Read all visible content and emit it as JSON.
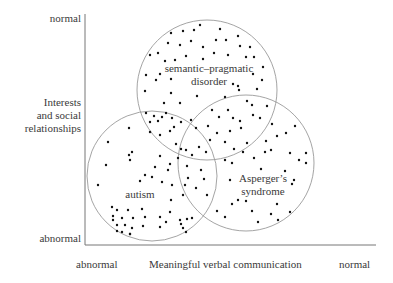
{
  "diagram": {
    "type": "venn-scatter",
    "y_axis": {
      "title_lines": [
        "Interests",
        "and social",
        "relationships"
      ],
      "top_label": "normal",
      "bottom_label": "abnormal"
    },
    "x_axis": {
      "title": "Meaningful verbal communication",
      "left_label": "abnormal",
      "right_label": "normal"
    },
    "circles": [
      {
        "name": "semantic-pragmatic disorder",
        "label_lines": [
          "semantic–pragmatic",
          "disorder"
        ],
        "cx": 207,
        "cy": 90,
        "r": 70
      },
      {
        "name": "autism",
        "label_lines": [
          "autism"
        ],
        "cx": 152,
        "cy": 176,
        "r": 65
      },
      {
        "name": "Asperger's syndrome",
        "label_lines": [
          "Asperger’s",
          "syndrome"
        ],
        "cx": 246,
        "cy": 163,
        "r": 68
      }
    ],
    "colors": {
      "axis": "#777777",
      "circle": "#9a9a9a",
      "dot": "#111111",
      "text": "#3a3a3a"
    }
  }
}
